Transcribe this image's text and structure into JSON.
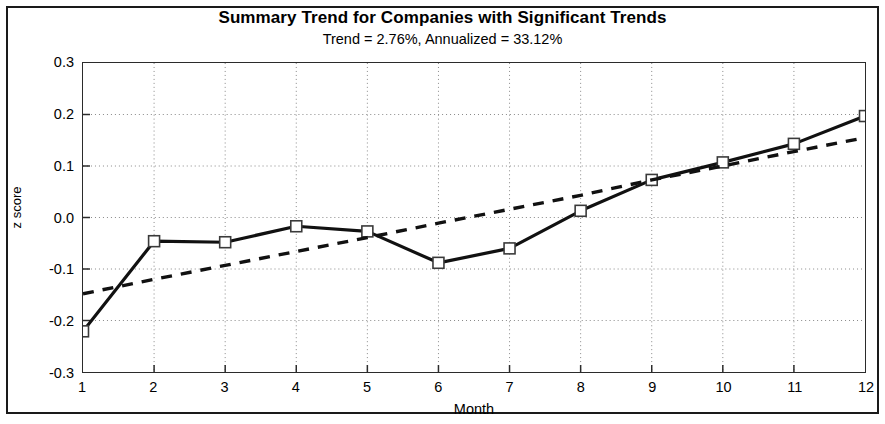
{
  "chart_data": {
    "type": "line",
    "title": "Summary Trend for Companies with Significant Trends",
    "subtitle": "Trend = 2.76%, Annualized = 33.12%",
    "xlabel": "Month",
    "ylabel": "z score",
    "x": [
      1,
      2,
      3,
      4,
      5,
      6,
      7,
      8,
      9,
      10,
      11,
      12
    ],
    "xticklabels": [
      "1",
      "2",
      "3",
      "4",
      "5",
      "6",
      "7",
      "8",
      "9",
      "10",
      "11",
      "12"
    ],
    "yticklabels": [
      "0.3",
      "0.2",
      "0.1",
      "0.0",
      "-0.1",
      "-0.2",
      "-0.3"
    ],
    "yticks": [
      0.3,
      0.2,
      0.1,
      0.0,
      -0.1,
      -0.2,
      -0.3
    ],
    "xlim": [
      1,
      12
    ],
    "ylim": [
      -0.3,
      0.3
    ],
    "grid": true,
    "grid_style": "dotted",
    "legend": "none",
    "series": [
      {
        "name": "Summary trend (observed)",
        "style": "solid",
        "marker": "open-square",
        "color": "#111111",
        "values": [
          -0.221,
          -0.046,
          -0.048,
          -0.017,
          -0.027,
          -0.088,
          -0.06,
          0.013,
          0.073,
          0.107,
          0.143,
          0.197
        ]
      },
      {
        "name": "Fitted linear trend",
        "style": "dashed",
        "marker": "none",
        "color": "#111111",
        "values": [
          -0.148,
          -0.12,
          -0.093,
          -0.066,
          -0.039,
          -0.011,
          0.016,
          0.043,
          0.073,
          0.1,
          0.128,
          0.155
        ]
      }
    ]
  },
  "figure": {
    "frame_color": "#1a1a1a",
    "background": "#ffffff"
  }
}
